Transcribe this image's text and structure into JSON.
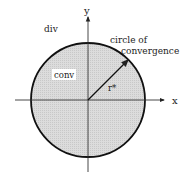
{
  "diagram": {
    "title": "",
    "labels": {
      "y_axis": "y",
      "x_axis": "x",
      "outside_region": "div",
      "inside_region": "conv",
      "circle_label_line1": "circle of",
      "circle_label_line2": "convergence",
      "radius": "r*"
    },
    "colors": {
      "fill": "#d9d9d9",
      "stroke": "#111111",
      "axis": "#333333",
      "background": "#ffffff"
    },
    "geometry": {
      "center": [
        88,
        100
      ],
      "radius": 57
    }
  }
}
